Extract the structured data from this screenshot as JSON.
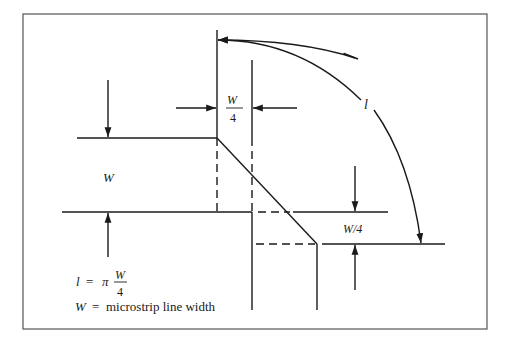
{
  "figure": {
    "labels": {
      "w_quarter_top_num": "W",
      "w_quarter_top_den": "4",
      "l_arc": "l",
      "w_left": "W",
      "w_quarter_right": "W/4"
    },
    "legend": {
      "eq1_lhs": "l",
      "eq1_eq": "=",
      "eq1_pi": "π",
      "eq1_num": "W",
      "eq1_den": "4",
      "eq2_lhs": "W",
      "eq2_eq": "=",
      "eq2_rhs": "microstrip line width"
    },
    "colors": {
      "line": "#1a1a1a",
      "border": "#555555",
      "background": "#ffffff"
    }
  }
}
